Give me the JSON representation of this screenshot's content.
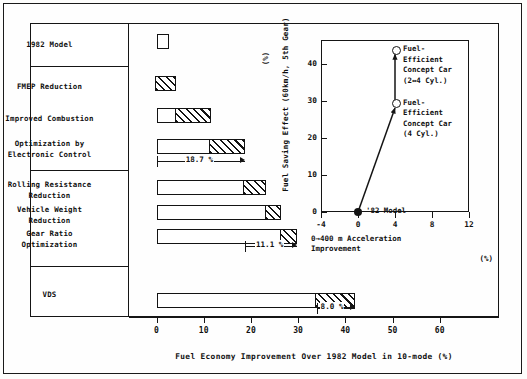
{
  "main": {
    "xtitle": "Fuel Economy Improvement Over 1982 Model in 10-mode   (%)",
    "ticks": [
      "0",
      "10",
      "20",
      "30",
      "40",
      "50",
      "60"
    ],
    "rows": [
      {
        "label": "1982 Model",
        "start": 0.0,
        "end": 0.0
      },
      {
        "label": "FMEP Reduction",
        "start": 0.0,
        "end": 4.2
      },
      {
        "label": "Improved Combustion",
        "start": 4.2,
        "end": 11.5
      },
      {
        "label": "Optimization by\nElectronic Control",
        "start": 11.5,
        "end": 18.7
      },
      {
        "label": "Rolling Resistance\nReduction",
        "start": 18.7,
        "end": 23.3
      },
      {
        "label": "Vehicle Weight\nReduction",
        "start": 23.3,
        "end": 26.4
      },
      {
        "label": "Gear Ratio\nOptimization",
        "start": 26.4,
        "end": 29.8
      },
      {
        "label": "VDS",
        "start": 33.9,
        "end": 42.0
      }
    ],
    "annotations": [
      {
        "text": "18.7 %",
        "from": 0.0,
        "to": 18.7
      },
      {
        "text": "11.1 %",
        "from": 18.7,
        "to": 29.8
      },
      {
        "text": "8.0 %",
        "from": 33.9,
        "to": 42.0
      }
    ]
  },
  "inset": {
    "ylabel": "Fuel Saving Effect (60km/h, 5th Gear)",
    "yunit": "(%)",
    "xlabel": "0→400 m Acceleration\nImprovement",
    "xunit": "(%)",
    "yticks": [
      "0",
      "10",
      "20",
      "30",
      "40"
    ],
    "xticks": [
      "-4",
      "0",
      "4",
      "8",
      "12"
    ],
    "points": [
      {
        "name": "'82 Model",
        "x": 0,
        "y": 0,
        "style": "filled",
        "label": "'82 Model"
      },
      {
        "name": "concept-4cyl",
        "x": 4,
        "y": 29.5,
        "style": "open",
        "label": "Fuel-\nEfficient\nConcept Car\n(4 Cyl.)"
      },
      {
        "name": "concept-2x4cyl",
        "x": 4,
        "y": 44,
        "style": "open",
        "label": "Fuel-\nEfficient\nConcept Car\n(2↔4 Cyl.)"
      }
    ]
  },
  "chart_data": {
    "type": "bar",
    "title": "Fuel Economy Improvement Over 1982 Model in 10-mode   (%)",
    "xlabel": "Fuel Economy Improvement Over 1982 Model in 10-mode (%)",
    "ylabel": "",
    "xlim": [
      -2,
      66
    ],
    "grid": false,
    "orientation": "horizontal",
    "note": "Cumulative waterfall: each bar starts where the previous ended; the hatched segment is that step's own contribution.",
    "categories": [
      "1982 Model",
      "FMEP Reduction",
      "Improved Combustion",
      "Optimization by Electronic Control",
      "Rolling Resistance Reduction",
      "Vehicle Weight Reduction",
      "Gear Ratio Optimization",
      "VDS"
    ],
    "cumulative_start": [
      0.0,
      0.0,
      4.2,
      11.5,
      18.7,
      23.3,
      26.4,
      33.9
    ],
    "cumulative_end": [
      0.0,
      4.2,
      11.5,
      18.7,
      23.3,
      26.4,
      29.8,
      42.0
    ],
    "increment": [
      0.0,
      4.2,
      7.3,
      7.2,
      4.6,
      3.1,
      3.4,
      8.1
    ],
    "group_totals": [
      {
        "label": "18.7 %",
        "from": 0.0,
        "to": 18.7,
        "value": 18.7
      },
      {
        "label": "11.1 %",
        "from": 18.7,
        "to": 29.8,
        "value": 11.1
      },
      {
        "label": "8.0 %",
        "from": 33.9,
        "to": 42.0,
        "value": 8.0
      }
    ],
    "xticks": [
      0,
      10,
      20,
      30,
      40,
      50,
      60
    ],
    "inset_chart": {
      "type": "scatter",
      "xlabel": "0→400 m Acceleration Improvement (%)",
      "ylabel": "Fuel Saving Effect (60km/h, 5th Gear) (%)",
      "xlim": [
        -4,
        12
      ],
      "ylim": [
        0,
        46
      ],
      "xticks": [
        -4,
        0,
        4,
        8,
        12
      ],
      "yticks": [
        0,
        10,
        20,
        30,
        40
      ],
      "points": [
        {
          "label": "'82 Model",
          "x": 0,
          "y": 0
        },
        {
          "label": "Fuel-Efficient Concept Car (4 Cyl.)",
          "x": 4,
          "y": 29.5
        },
        {
          "label": "Fuel-Efficient Concept Car (2↔4 Cyl.)",
          "x": 4,
          "y": 44
        }
      ],
      "arrows": [
        {
          "from": [
            0,
            0
          ],
          "to": [
            4,
            29.5
          ]
        },
        {
          "from": [
            4,
            29.5
          ],
          "to": [
            4,
            44
          ]
        }
      ]
    }
  }
}
